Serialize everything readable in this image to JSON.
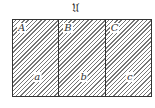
{
  "title": "𝔘",
  "regions": [
    {
      "upper_label": "A",
      "lower_label": "a"
    },
    {
      "upper_label": "B",
      "lower_label": "b"
    },
    {
      "upper_label": "C",
      "lower_label": "c"
    }
  ],
  "colors": {
    "border": "#333333",
    "hatch": "#777777",
    "background": "#ffffff"
  }
}
